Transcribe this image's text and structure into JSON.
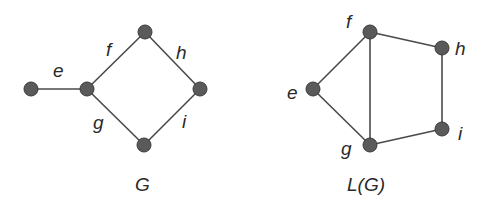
{
  "figure": {
    "graph_G": {
      "caption": "G",
      "nodes": [
        {
          "id": "n1",
          "x": 31,
          "y": 89
        },
        {
          "id": "n2",
          "x": 87,
          "y": 89
        },
        {
          "id": "n3",
          "x": 145,
          "y": 32
        },
        {
          "id": "n4",
          "x": 200,
          "y": 89
        },
        {
          "id": "n5",
          "x": 144,
          "y": 145
        }
      ],
      "edges": [
        {
          "label": "e",
          "from": "n1",
          "to": "n2",
          "lx": 57,
          "ly": 76
        },
        {
          "label": "f",
          "from": "n2",
          "to": "n3",
          "lx": 105,
          "ly": 55
        },
        {
          "label": "h",
          "from": "n3",
          "to": "n4",
          "lx": 180,
          "ly": 58
        },
        {
          "label": "g",
          "from": "n2",
          "to": "n5",
          "lx": 96,
          "ly": 128
        },
        {
          "label": "i",
          "from": "n5",
          "to": "n4",
          "lx": 182,
          "ly": 128
        }
      ]
    },
    "graph_LG": {
      "caption": "L(G)",
      "nodes": [
        {
          "id": "f",
          "label": "f",
          "x": 370,
          "y": 32,
          "lx": 346,
          "ly": 24
        },
        {
          "id": "h",
          "label": "h",
          "x": 442,
          "y": 48,
          "lx": 456,
          "ly": 54
        },
        {
          "id": "e",
          "label": "e",
          "x": 313,
          "y": 89,
          "lx": 288,
          "ly": 98
        },
        {
          "id": "i",
          "label": "i",
          "x": 442,
          "y": 129,
          "lx": 458,
          "ly": 140
        },
        {
          "id": "g",
          "label": "g",
          "x": 370,
          "y": 145,
          "lx": 342,
          "ly": 154
        }
      ],
      "edges": [
        [
          "e",
          "f"
        ],
        [
          "e",
          "g"
        ],
        [
          "f",
          "g"
        ],
        [
          "f",
          "h"
        ],
        [
          "h",
          "i"
        ],
        [
          "g",
          "i"
        ]
      ]
    }
  }
}
